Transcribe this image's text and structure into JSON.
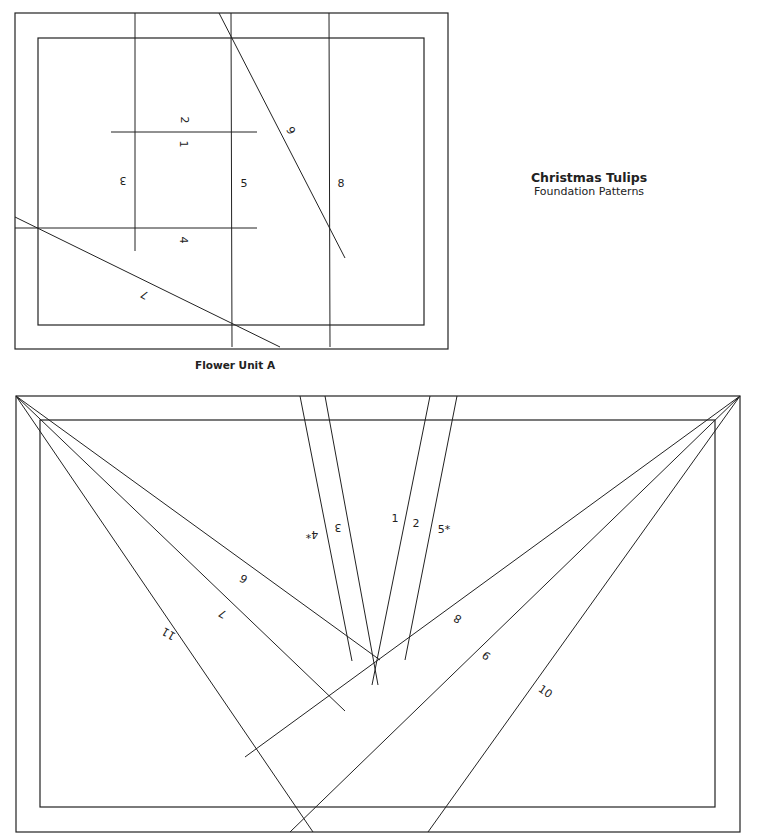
{
  "title": {
    "main": "Christmas Tulips",
    "sub": "Foundation Patterns"
  },
  "unitA": {
    "caption": "Flower Unit A",
    "outer": [
      15,
      13,
      448,
      349
    ],
    "inner": [
      38,
      38,
      424,
      325
    ],
    "lines": [
      [
        135,
        13,
        135,
        251
      ],
      [
        231,
        13,
        232,
        347
      ],
      [
        329,
        13,
        330,
        347
      ],
      [
        111,
        132,
        257,
        132
      ],
      [
        15,
        228,
        257,
        228
      ],
      [
        219,
        13,
        345,
        258
      ],
      [
        15,
        217,
        280,
        347
      ]
    ],
    "labels": [
      {
        "t": "2",
        "x": 184,
        "y": 120,
        "r": 90
      },
      {
        "t": "1",
        "x": 183,
        "y": 144,
        "r": 90
      },
      {
        "t": "3",
        "x": 123,
        "y": 180,
        "r": 180
      },
      {
        "t": "5",
        "x": 244,
        "y": 184,
        "r": 0
      },
      {
        "t": "8",
        "x": 341,
        "y": 184,
        "r": 0
      },
      {
        "t": "6",
        "x": 292,
        "y": 130,
        "r": -120
      },
      {
        "t": "4",
        "x": 183,
        "y": 240,
        "r": 90
      },
      {
        "t": "7",
        "x": 145,
        "y": 294,
        "r": 210
      }
    ]
  },
  "unitB": {
    "outer": [
      16,
      396,
      740,
      832
    ],
    "inner": [
      40,
      420,
      715,
      807
    ],
    "lines": [
      [
        16,
        396,
        313,
        832
      ],
      [
        16,
        396,
        345,
        711
      ],
      [
        16,
        396,
        380,
        660
      ],
      [
        740,
        396,
        245,
        757
      ],
      [
        740,
        396,
        290,
        832
      ],
      [
        740,
        396,
        428,
        832
      ],
      [
        300,
        396,
        352,
        661
      ],
      [
        325,
        396,
        378,
        685
      ],
      [
        430,
        396,
        372,
        685
      ],
      [
        457,
        396,
        405,
        660
      ]
    ],
    "labels": [
      {
        "t": "4*",
        "x": 312,
        "y": 534,
        "r": 180
      },
      {
        "t": "3",
        "x": 338,
        "y": 527,
        "r": 180
      },
      {
        "t": "1",
        "x": 395,
        "y": 519,
        "r": 0
      },
      {
        "t": "2",
        "x": 416,
        "y": 524,
        "r": 0
      },
      {
        "t": "5*",
        "x": 444,
        "y": 530,
        "r": 0
      },
      {
        "t": "6",
        "x": 244,
        "y": 578,
        "r": 210
      },
      {
        "t": "7",
        "x": 223,
        "y": 613,
        "r": 210
      },
      {
        "t": "11",
        "x": 169,
        "y": 633,
        "r": 210
      },
      {
        "t": "8",
        "x": 458,
        "y": 618,
        "r": -150
      },
      {
        "t": "9",
        "x": 487,
        "y": 655,
        "r": -140
      },
      {
        "t": "10",
        "x": 545,
        "y": 692,
        "r": 35
      }
    ]
  }
}
